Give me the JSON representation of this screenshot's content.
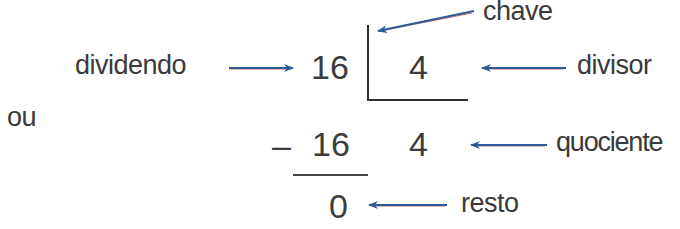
{
  "diagram": {
    "connector_word": "ou",
    "colors": {
      "text": "#3a3a3a",
      "arrow": "#2f5a96",
      "arrow_shadow": "#c86a6a",
      "lines": "#2e2e2e"
    },
    "key_form": {
      "dividend": "16",
      "divisor": "4"
    },
    "long_form": {
      "minus_sign": "–",
      "subtracted": "16",
      "quotient": "4",
      "remainder": "0"
    },
    "labels": {
      "dividend": "dividendo",
      "divisor": "divisor",
      "key": "chave",
      "quotient": "quociente",
      "remainder": "resto"
    }
  }
}
